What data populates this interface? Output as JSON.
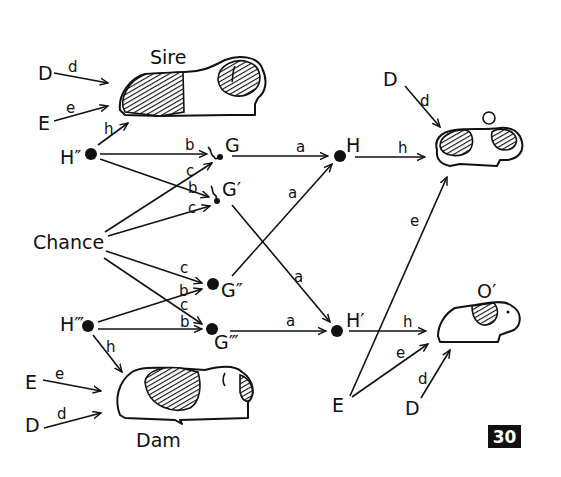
{
  "figure": {
    "number": "30"
  },
  "labels": {
    "sire": "Sire",
    "dam": "Dam",
    "offspring1": "O",
    "offspring2": "O′",
    "chance": "Chance",
    "H_sire": "H″",
    "H_dam": "H‴",
    "G": "G",
    "G1": "G′",
    "G2": "G″",
    "G3": "G‴",
    "H": "H",
    "H1": "H′",
    "D": "D",
    "E": "E"
  },
  "path_coefficients": {
    "a": "a",
    "b": "b",
    "c": "c",
    "d": "d",
    "e": "e",
    "h": "h"
  },
  "nodes": [
    {
      "id": "D_sire",
      "label": "D"
    },
    {
      "id": "E_sire",
      "label": "E"
    },
    {
      "id": "Sire",
      "label": "Sire"
    },
    {
      "id": "H2",
      "label": "H″"
    },
    {
      "id": "Chance",
      "label": "Chance"
    },
    {
      "id": "H3",
      "label": "H‴"
    },
    {
      "id": "E_dam",
      "label": "E"
    },
    {
      "id": "D_dam",
      "label": "D"
    },
    {
      "id": "Dam",
      "label": "Dam"
    },
    {
      "id": "G",
      "label": "G"
    },
    {
      "id": "G1",
      "label": "G′"
    },
    {
      "id": "G2",
      "label": "G″"
    },
    {
      "id": "G3",
      "label": "G‴"
    },
    {
      "id": "H",
      "label": "H"
    },
    {
      "id": "H1",
      "label": "H′"
    },
    {
      "id": "D_O",
      "label": "D"
    },
    {
      "id": "O",
      "label": "O"
    },
    {
      "id": "O1",
      "label": "O′"
    },
    {
      "id": "E_shared",
      "label": "E"
    },
    {
      "id": "D_O1",
      "label": "D"
    }
  ],
  "edges": [
    {
      "from": "D_sire",
      "to": "Sire",
      "label": "d"
    },
    {
      "from": "E_sire",
      "to": "Sire",
      "label": "e"
    },
    {
      "from": "H2",
      "to": "Sire",
      "label": "h"
    },
    {
      "from": "H2",
      "to": "G",
      "label": "b"
    },
    {
      "from": "H2",
      "to": "G1",
      "label": "b"
    },
    {
      "from": "Chance",
      "to": "G",
      "label": "c"
    },
    {
      "from": "Chance",
      "to": "G1",
      "label": "c"
    },
    {
      "from": "Chance",
      "to": "G2",
      "label": "c"
    },
    {
      "from": "Chance",
      "to": "G3",
      "label": "c"
    },
    {
      "from": "H3",
      "to": "G2",
      "label": "b"
    },
    {
      "from": "H3",
      "to": "G3",
      "label": "b"
    },
    {
      "from": "H3",
      "to": "Dam",
      "label": "h"
    },
    {
      "from": "E_dam",
      "to": "Dam",
      "label": "e"
    },
    {
      "from": "D_dam",
      "to": "Dam",
      "label": "d"
    },
    {
      "from": "G",
      "to": "H",
      "label": "a"
    },
    {
      "from": "G2",
      "to": "H",
      "label": "a"
    },
    {
      "from": "G1",
      "to": "H1",
      "label": "a"
    },
    {
      "from": "G3",
      "to": "H1",
      "label": "a"
    },
    {
      "from": "H",
      "to": "O",
      "label": "h"
    },
    {
      "from": "D_O",
      "to": "O",
      "label": "d"
    },
    {
      "from": "E_shared",
      "to": "O",
      "label": "e"
    },
    {
      "from": "H1",
      "to": "O1",
      "label": "h"
    },
    {
      "from": "E_shared",
      "to": "O1",
      "label": "e"
    },
    {
      "from": "D_O1",
      "to": "O1",
      "label": "d"
    }
  ]
}
